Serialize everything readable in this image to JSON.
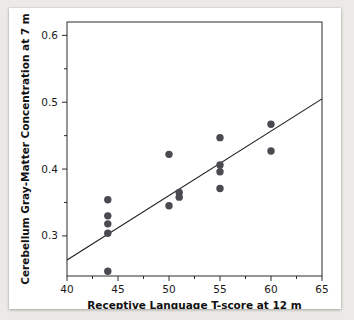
{
  "chart_data": {
    "type": "scatter",
    "title": "",
    "xlabel": "Receptive Language T-score at 12 m",
    "ylabel": "Cerebellum Gray-Matter Concentration at 7 m",
    "xlim": [
      40,
      65
    ],
    "ylim": [
      0.24,
      0.62
    ],
    "grid": false,
    "legend": null,
    "xticks": [
      40,
      45,
      50,
      55,
      60,
      65
    ],
    "xticklabels": [
      "40",
      "45",
      "50",
      "55",
      "60",
      "65"
    ],
    "xminorticks": [
      42.5,
      47.5,
      52.5,
      57.5,
      62.5
    ],
    "yticks": [
      0.3,
      0.4,
      0.5,
      0.6
    ],
    "yticklabels": [
      "0.3",
      "0.4",
      "0.5",
      "0.6"
    ],
    "yminorticks": [
      0.35,
      0.45,
      0.55
    ],
    "marker": "filled-circle",
    "marker_color": "#4a4a50",
    "points": [
      {
        "x": 44,
        "y": 0.354
      },
      {
        "x": 44,
        "y": 0.33
      },
      {
        "x": 44,
        "y": 0.318
      },
      {
        "x": 44,
        "y": 0.304
      },
      {
        "x": 44,
        "y": 0.247
      },
      {
        "x": 50,
        "y": 0.422
      },
      {
        "x": 50,
        "y": 0.345
      },
      {
        "x": 51,
        "y": 0.365
      },
      {
        "x": 51,
        "y": 0.358
      },
      {
        "x": 55,
        "y": 0.447
      },
      {
        "x": 55,
        "y": 0.406
      },
      {
        "x": 55,
        "y": 0.396
      },
      {
        "x": 55,
        "y": 0.371
      },
      {
        "x": 60,
        "y": 0.467
      },
      {
        "x": 60,
        "y": 0.427
      }
    ],
    "fit_line": {
      "type": "linear-regression",
      "x_start": 40,
      "y_start": 0.264,
      "x_end": 65,
      "y_end": 0.505,
      "color": "#1c1c1c"
    }
  }
}
